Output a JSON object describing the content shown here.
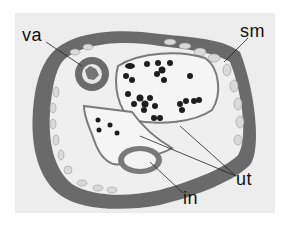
{
  "figure": {
    "type": "histology micrograph, cross-section",
    "colors": {
      "background": "#ededed",
      "body_wall": "#6a6a6a",
      "muscle_cells": "#d8d8d8",
      "cavity": "#f2f2f2",
      "eggs": "#1e1e1e",
      "membrane": "#7a7a7a"
    },
    "labels": [
      {
        "id": "va",
        "text": "va"
      },
      {
        "id": "sm",
        "text": "sm"
      },
      {
        "id": "ut",
        "text": "ut"
      },
      {
        "id": "in",
        "text": "in"
      }
    ]
  }
}
